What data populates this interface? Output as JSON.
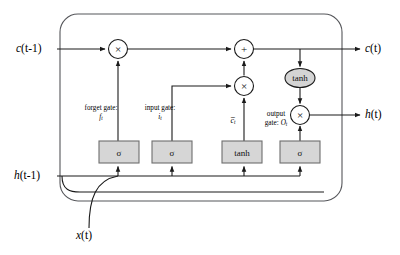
{
  "figure": {
    "type": "diagram"
  },
  "colors": {
    "background": "#ffffff",
    "wire": "#1a1a1a",
    "cell_outline": "#55565a",
    "gate_box_fill": "#d6d6d6",
    "gate_box_stroke": "#6e6e6e",
    "ellipse_fill": "#d4d4d4",
    "circle_fill": "#ffffff",
    "text": "#000000"
  },
  "io_labels": {
    "cell_state_in": "c(t-1)",
    "cell_state_in_var": "c",
    "cell_state_in_arg": "(t-1)",
    "cell_state_out": "c(t)",
    "cell_state_out_var": "c",
    "cell_state_out_arg": "(t)",
    "hidden_in": "h(t-1)",
    "hidden_in_var": "h",
    "hidden_in_arg": "(t-1)",
    "hidden_out": "h(t)",
    "hidden_out_var": "h",
    "hidden_out_arg": "(t)",
    "input": "x(t)",
    "input_var": "x",
    "input_arg": "(t)"
  },
  "gate_labels": {
    "forget": {
      "line1": "forget gate:",
      "symbol": "f",
      "subscript": "t"
    },
    "input": {
      "line1": "input gate:",
      "symbol": "i",
      "subscript": "t"
    },
    "candidate": {
      "symbol": "c̅",
      "subscript": "t"
    },
    "output": {
      "line1": "output",
      "line2": "gate:",
      "symbol": "O",
      "subscript": "t"
    }
  },
  "gate_boxes": [
    {
      "id": "forget-gate-box",
      "glyph": "σ",
      "x": 99,
      "y": 141,
      "w": 40,
      "h": 22
    },
    {
      "id": "input-gate-box",
      "glyph": "σ",
      "x": 152,
      "y": 141,
      "w": 40,
      "h": 22
    },
    {
      "id": "candidate-tanh-box",
      "glyph": "tanh",
      "x": 222,
      "y": 141,
      "w": 40,
      "h": 22
    },
    {
      "id": "output-gate-box",
      "glyph": "σ",
      "x": 280,
      "y": 141,
      "w": 40,
      "h": 22
    }
  ],
  "operators": [
    {
      "id": "forget-multiply",
      "glyph": "×",
      "cx": 118,
      "cy": 49,
      "r": 9.5,
      "shape": "circle"
    },
    {
      "id": "cell-add",
      "glyph": "+",
      "cx": 244,
      "cy": 49,
      "r": 9.5,
      "shape": "circle"
    },
    {
      "id": "input-multiply",
      "glyph": "×",
      "cx": 244,
      "cy": 86,
      "r": 9.5,
      "shape": "circle"
    },
    {
      "id": "output-tanh",
      "glyph": "tanh",
      "cx": 300,
      "cy": 78,
      "rx": 15,
      "ry": 9.5,
      "shape": "ellipse"
    },
    {
      "id": "output-multiply",
      "glyph": "×",
      "cx": 300,
      "cy": 115,
      "r": 9.5,
      "shape": "circle"
    }
  ],
  "cell_outline": {
    "x": 60,
    "y": 14,
    "w": 282,
    "h": 187,
    "rx": 18
  },
  "rails": {
    "cell_state_y": 49,
    "hidden_y": 176,
    "input_branch_y": 192
  }
}
